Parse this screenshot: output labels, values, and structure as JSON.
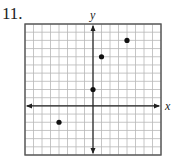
{
  "problem": {
    "number": "11."
  },
  "chart_data": {
    "type": "scatter",
    "title": "",
    "xlabel": "x",
    "ylabel": "y",
    "xlim": [
      -8,
      8
    ],
    "ylim": [
      -6,
      10
    ],
    "grid": true,
    "grid_step": 1,
    "tick_labels": false,
    "legend": null,
    "points": [
      {
        "x": -4,
        "y": -2
      },
      {
        "x": 0,
        "y": 2
      },
      {
        "x": 1,
        "y": 6
      },
      {
        "x": 4,
        "y": 8
      }
    ]
  },
  "colors": {
    "grid": "#b8b8b8",
    "border": "#555555",
    "axis": "#222222",
    "point": "#111111"
  }
}
